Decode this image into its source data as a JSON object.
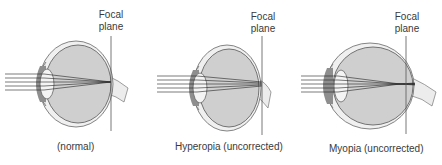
{
  "figure": {
    "panels": [
      {
        "id": "normal",
        "caption": "(normal)",
        "focal_label_line1": "Focal",
        "focal_label_line2": "plane"
      },
      {
        "id": "hyperopia",
        "caption": "Hyperopia (uncorrected)",
        "focal_label_line1": "Focal",
        "focal_label_line2": "plane"
      },
      {
        "id": "myopia",
        "caption": "Myopia (uncorrected)",
        "focal_label_line1": "Focal",
        "focal_label_line2": "plane"
      }
    ],
    "colors": {
      "sclera_fill": "#f0f0f0",
      "vitreous_fill": "#cfcfcf",
      "iris_fill": "#8e8e8e",
      "lens_fill": "#f4f4f4",
      "outline": "#555555",
      "rays": "#222222"
    }
  }
}
